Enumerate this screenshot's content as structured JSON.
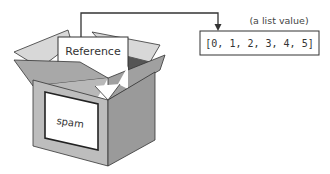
{
  "diagram": {
    "box": {
      "label": "spam",
      "card_label": "Reference"
    },
    "target": {
      "caption": "(a list value)",
      "value": "[0, 1, 2, 3, 4, 5]"
    },
    "colors": {
      "line": "#333333",
      "front_face": "#bdbdbd",
      "side_face": "#9e9e9e",
      "flap_light": "#d6d6d6",
      "flap_dark": "#a8a8a8",
      "inside": "#555555",
      "card": "#ffffff"
    }
  }
}
